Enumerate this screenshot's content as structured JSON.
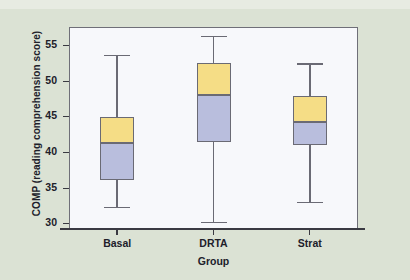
{
  "chart_data": {
    "type": "box",
    "title": "",
    "xlabel": "Group",
    "ylabel": "COMP (reading comprehension score)",
    "categories": [
      "Basal",
      "DRTA",
      "Strat"
    ],
    "ylim": [
      29.2,
      57.5
    ],
    "yticks": [
      30,
      35,
      40,
      45,
      50,
      55
    ],
    "ytick_labels": [
      "30",
      "35",
      "40",
      "45",
      "50",
      "55"
    ],
    "grid": false,
    "legend": null,
    "colors": {
      "upper_box": "#f5dd86",
      "lower_box": "#b9bedd",
      "outline": "#6a6a74",
      "plot_background": "#f7f8fb",
      "figure_background": "#dbe2d4",
      "text": "#20202a"
    },
    "boxes": [
      {
        "category": "Basal",
        "min": 32.3,
        "q1": 36.1,
        "median": 41.2,
        "q3": 44.9,
        "max": 53.6
      },
      {
        "category": "DRTA",
        "min": 30.2,
        "q1": 41.4,
        "median": 48.0,
        "q3": 52.4,
        "max": 56.3
      },
      {
        "category": "Strat",
        "min": 33.0,
        "q1": 41.0,
        "median": 44.2,
        "q3": 47.8,
        "max": 52.4
      }
    ]
  }
}
